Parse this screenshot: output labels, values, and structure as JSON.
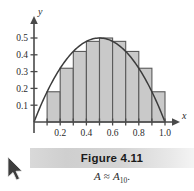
{
  "figure": {
    "caption_title": "Figure 4.11",
    "caption_formula_prefix": "A",
    "caption_formula_relation": "≈",
    "caption_formula_symbol": "A",
    "caption_formula_subscript": "10",
    "caption_formula_period": "."
  },
  "axes": {
    "x_axis_label": "x",
    "y_axis_label": "y",
    "x_tick_labels": [
      "0.2",
      "0.4",
      "0.6",
      "0.8",
      "1.0"
    ],
    "y_tick_labels": [
      "0.5",
      "0.4",
      "0.3",
      "0.2",
      "0.1"
    ]
  },
  "cursor": {
    "name": "mouse-pointer"
  },
  "chart_data": {
    "type": "bar",
    "title": "Figure 4.11",
    "subtitle": "A ≈ A10.",
    "xlabel": "x",
    "ylabel": "y",
    "xlim": [
      0,
      1.05
    ],
    "ylim": [
      0,
      0.56
    ],
    "grid": false,
    "legend": null,
    "bar_width": 0.1,
    "bar_alignment": "left-endpoint",
    "bar_fill_color": "#c9c9c9",
    "bar_edge_color": "#5a5a5a",
    "curve_color": "#3c3c3c",
    "axis_color": "#4a4a4a",
    "x_ticks": [
      0.2,
      0.4,
      0.6,
      0.8,
      1.0
    ],
    "y_ticks": [
      0.1,
      0.2,
      0.3,
      0.4,
      0.5
    ],
    "categories": [
      "0.0",
      "0.1",
      "0.2",
      "0.3",
      "0.4",
      "0.5",
      "0.6",
      "0.7",
      "0.8",
      "0.9"
    ],
    "bar_left_edges": [
      0.0,
      0.1,
      0.2,
      0.3,
      0.4,
      0.5,
      0.6,
      0.7,
      0.8,
      0.9
    ],
    "values": [
      0.0,
      0.18,
      0.32,
      0.42,
      0.48,
      0.5,
      0.48,
      0.42,
      0.32,
      0.18
    ],
    "series": [
      {
        "name": "A10 left-endpoint rectangles",
        "values": [
          0.0,
          0.18,
          0.32,
          0.42,
          0.48,
          0.5,
          0.48,
          0.42,
          0.32,
          0.18
        ]
      },
      {
        "name": "curve y = 2x(1 - x)",
        "type": "line",
        "x": [
          0.0,
          0.1,
          0.2,
          0.3,
          0.4,
          0.5,
          0.6,
          0.7,
          0.8,
          0.9,
          1.0
        ],
        "y": [
          0.0,
          0.18,
          0.32,
          0.42,
          0.48,
          0.5,
          0.48,
          0.42,
          0.32,
          0.18,
          0.0
        ]
      }
    ]
  }
}
